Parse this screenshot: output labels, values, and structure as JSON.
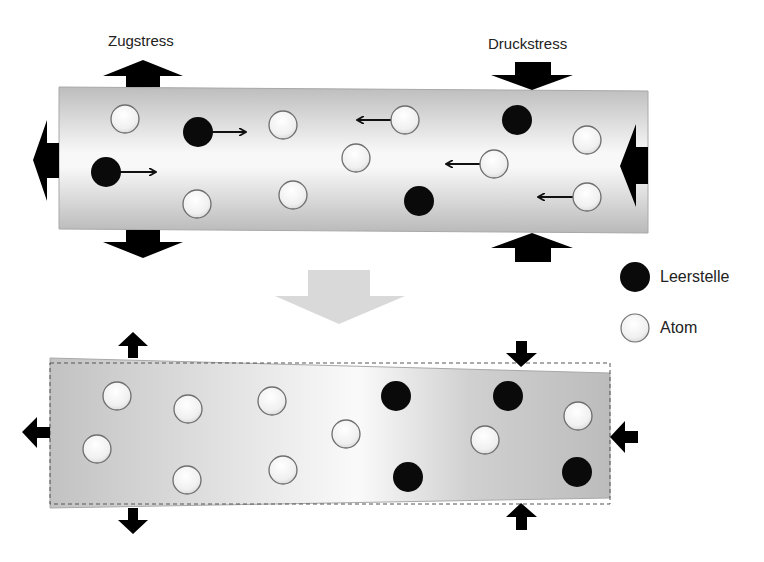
{
  "labels": {
    "tensile": "Zugstress",
    "compressive": "Druckstress"
  },
  "legend": {
    "vacancy": "Leerstelle",
    "atom": "Atom"
  },
  "colors": {
    "vacancy": "#0a0a0a",
    "atom_fill": "#f4f4f4",
    "atom_stroke": "#6e6e6e",
    "bar_dark": "#b8b8b8",
    "bar_light": "#f7f7f7",
    "stress_arrow": "#111111",
    "transition_arrow": "#d9d9d9"
  },
  "top_panel": {
    "atoms": [
      {
        "x": 125,
        "y": 119
      },
      {
        "x": 283,
        "y": 125
      },
      {
        "x": 405,
        "y": 120
      },
      {
        "x": 587,
        "y": 140
      },
      {
        "x": 356,
        "y": 158
      },
      {
        "x": 494,
        "y": 164
      },
      {
        "x": 197,
        "y": 204
      },
      {
        "x": 293,
        "y": 195
      },
      {
        "x": 587,
        "y": 197
      }
    ],
    "vacancies": [
      {
        "x": 198,
        "y": 132
      },
      {
        "x": 517,
        "y": 120
      },
      {
        "x": 106,
        "y": 172
      },
      {
        "x": 419,
        "y": 201
      }
    ],
    "motion_arrows": [
      {
        "from": [
          212,
          132
        ],
        "to": [
          245,
          132
        ],
        "dir": "right"
      },
      {
        "from": [
          120,
          172
        ],
        "to": [
          155,
          172
        ],
        "dir": "right"
      },
      {
        "from": [
          391,
          120
        ],
        "to": [
          358,
          120
        ],
        "dir": "left"
      },
      {
        "from": [
          480,
          164
        ],
        "to": [
          447,
          164
        ],
        "dir": "left"
      },
      {
        "from": [
          573,
          197
        ],
        "to": [
          539,
          197
        ],
        "dir": "left"
      }
    ]
  },
  "bottom_panel": {
    "atoms": [
      {
        "x": 117,
        "y": 396
      },
      {
        "x": 188,
        "y": 409
      },
      {
        "x": 97,
        "y": 449
      },
      {
        "x": 187,
        "y": 480
      },
      {
        "x": 272,
        "y": 401
      },
      {
        "x": 283,
        "y": 470
      },
      {
        "x": 346,
        "y": 434
      },
      {
        "x": 485,
        "y": 440
      },
      {
        "x": 578,
        "y": 416
      }
    ],
    "vacancies": [
      {
        "x": 396,
        "y": 396
      },
      {
        "x": 408,
        "y": 477
      },
      {
        "x": 508,
        "y": 396
      },
      {
        "x": 577,
        "y": 472
      }
    ]
  }
}
